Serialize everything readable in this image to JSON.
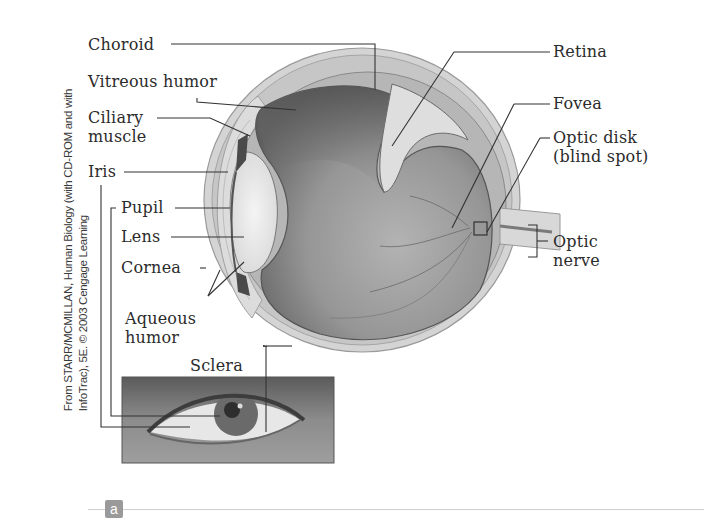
{
  "figure": {
    "panel_label": "a",
    "credit_lines": [
      "From STARR/MCMILLAN, Human Biology (with CD-ROM and with",
      "InfoTrac), 5E. © 2003 Cengage Learning"
    ]
  },
  "labels": {
    "choroid": "Choroid",
    "vitreous_humor": "Vitreous humor",
    "ciliary_muscle_1": "Ciliary",
    "ciliary_muscle_2": "muscle",
    "iris": "Iris",
    "pupil": "Pupil",
    "lens": "Lens",
    "cornea": "Cornea",
    "aqueous_humor_1": "Aqueous",
    "aqueous_humor_2": "humor",
    "sclera": "Sclera",
    "retina": "Retina",
    "fovea": "Fovea",
    "optic_disk_1": "Optic disk",
    "optic_disk_2": "(blind spot)",
    "optic_nerve_1": "Optic",
    "optic_nerve_2": "nerve"
  },
  "colors": {
    "ink": "#2b2b2b",
    "leader": "#333333",
    "sclera_fill": "#d9d9d9",
    "vitreous_dark": "#6f6f6f",
    "vitreous_light": "#a9a9a9",
    "lens_fill": "#ececec",
    "badge": "#9a9a9a"
  }
}
